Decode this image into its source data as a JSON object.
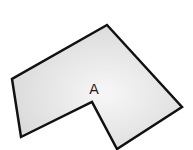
{
  "diagram": {
    "shape": {
      "type": "polygon",
      "vertices": [
        [
          107,
          25
        ],
        [
          182,
          107
        ],
        [
          117,
          149
        ],
        [
          92,
          102
        ],
        [
          21,
          137
        ],
        [
          12,
          79
        ]
      ],
      "fill": "#e6e6e6",
      "stroke": "#111111",
      "label": "A"
    }
  }
}
